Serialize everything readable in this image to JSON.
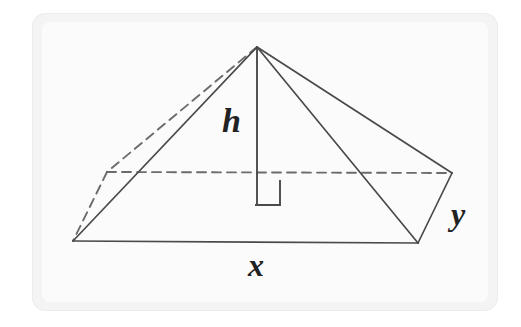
{
  "figure": {
    "kind": "rectangular-pyramid-diagram",
    "labels": {
      "height": "h",
      "base_length": "x",
      "base_width": "y"
    },
    "colors": {
      "card_background": "#f4f4f4",
      "plate_background": "#fbfbfb",
      "stroke": "#4a4a4a",
      "hidden_stroke": "#6b6b6b",
      "label_color": "#222222",
      "page_background": "#ffffff"
    },
    "geometry": {
      "apex": [
        257,
        47
      ],
      "front_left": [
        73,
        241
      ],
      "front_right": [
        418,
        243
      ],
      "back_left": [
        107,
        172
      ],
      "back_right": [
        452,
        173
      ],
      "height_foot": [
        257,
        205
      ],
      "right_angle_marker": [
        256,
        181,
        24,
        24
      ]
    },
    "edges": [
      {
        "name": "apex-to-front-left",
        "style": "solid"
      },
      {
        "name": "apex-to-front-right",
        "style": "solid"
      },
      {
        "name": "apex-to-back-right",
        "style": "solid"
      },
      {
        "name": "apex-to-back-left",
        "style": "dashed"
      },
      {
        "name": "base-front",
        "style": "solid"
      },
      {
        "name": "base-right",
        "style": "solid"
      },
      {
        "name": "base-left-hidden",
        "style": "dashed"
      },
      {
        "name": "base-back-hidden",
        "style": "dashed"
      },
      {
        "name": "height-segment",
        "style": "solid"
      }
    ]
  }
}
